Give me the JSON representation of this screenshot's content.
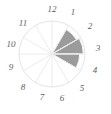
{
  "figure": {
    "type_name": "polar-sector-diagram",
    "background_color": "#ffffff",
    "frame_line_color": "#dadada"
  },
  "geometry": {
    "center_x": 52,
    "center_y": 54,
    "outer_radius": 33,
    "sector_count": 12,
    "degrees_per_sector": 30
  },
  "style": {
    "sector_fill_color": "#9b9b9b",
    "spoke_color": "#ececec",
    "circle_outline_color": "#e4e4e4",
    "label_color": "#5e5e5e",
    "label_font_size": "9px"
  },
  "labels": [
    {
      "text": "12",
      "hour": 12,
      "x": 52,
      "y": 9
    },
    {
      "text": "1",
      "hour": 1,
      "x": 73,
      "y": 12
    },
    {
      "text": "2",
      "hour": 2,
      "x": 90,
      "y": 26
    },
    {
      "text": "3",
      "hour": 3,
      "x": 98,
      "y": 48
    },
    {
      "text": "4",
      "hour": 4,
      "x": 95,
      "y": 70
    },
    {
      "text": "5",
      "hour": 5,
      "x": 82,
      "y": 88
    },
    {
      "text": "6",
      "hour": 6,
      "x": 62,
      "y": 98
    },
    {
      "text": "7",
      "hour": 7,
      "x": 42,
      "y": 97
    },
    {
      "text": "8",
      "hour": 8,
      "x": 23,
      "y": 87
    },
    {
      "text": "9",
      "hour": 9,
      "x": 11,
      "y": 67
    },
    {
      "text": "10",
      "hour": 10,
      "x": 11,
      "y": 44
    },
    {
      "text": "11",
      "hour": 11,
      "x": 23,
      "y": 23
    }
  ],
  "chart_data": {
    "type": "pie",
    "subtitle": "",
    "xlabel": "",
    "ylabel": "",
    "legend_position": "none",
    "grid": true,
    "axis_ranges": {
      "theta_deg": [
        0,
        360
      ],
      "r": [
        0,
        1
      ]
    },
    "categories": [
      "12",
      "1",
      "2",
      "3",
      "4",
      "5",
      "6",
      "7",
      "8",
      "9",
      "10",
      "11"
    ],
    "tick_labels": [
      "1",
      "2",
      "3",
      "4",
      "5",
      "6",
      "7",
      "8",
      "9",
      "10",
      "11",
      "12"
    ],
    "series": [
      {
        "name": "sector magnitude",
        "values": [
          0,
          0.86,
          0.95,
          0.84,
          0,
          0,
          0,
          0,
          0,
          0,
          0,
          0
        ]
      }
    ],
    "sectors": [
      {
        "label": "12",
        "start_hour": 12,
        "end_hour": 1,
        "start_deg": 0,
        "end_deg": 30,
        "value": 0,
        "filled": false
      },
      {
        "label": "1",
        "start_hour": 1,
        "end_hour": 2,
        "start_deg": 30,
        "end_deg": 60,
        "value": 0.86,
        "filled": true
      },
      {
        "label": "2",
        "start_hour": 2,
        "end_hour": 3,
        "start_deg": 60,
        "end_deg": 90,
        "value": 0.95,
        "filled": true
      },
      {
        "label": "3",
        "start_hour": 3,
        "end_hour": 4,
        "start_deg": 90,
        "end_deg": 120,
        "value": 0.84,
        "filled": true
      },
      {
        "label": "4",
        "start_hour": 4,
        "end_hour": 5,
        "start_deg": 120,
        "end_deg": 150,
        "value": 0,
        "filled": false
      },
      {
        "label": "5",
        "start_hour": 5,
        "end_hour": 6,
        "start_deg": 150,
        "end_deg": 180,
        "value": 0,
        "filled": false
      },
      {
        "label": "6",
        "start_hour": 6,
        "end_hour": 7,
        "start_deg": 180,
        "end_deg": 210,
        "value": 0,
        "filled": false
      },
      {
        "label": "7",
        "start_hour": 7,
        "end_hour": 8,
        "start_deg": 210,
        "end_deg": 240,
        "value": 0,
        "filled": false
      },
      {
        "label": "8",
        "start_hour": 8,
        "end_hour": 9,
        "start_deg": 240,
        "end_deg": 270,
        "value": 0,
        "filled": false
      },
      {
        "label": "9",
        "start_hour": 9,
        "end_hour": 10,
        "start_deg": 270,
        "end_deg": 300,
        "value": 0,
        "filled": false
      },
      {
        "label": "10",
        "start_hour": 10,
        "end_hour": 11,
        "start_deg": 300,
        "end_deg": 330,
        "value": 0,
        "filled": false
      },
      {
        "label": "11",
        "start_hour": 11,
        "end_hour": 12,
        "start_deg": 330,
        "end_deg": 360,
        "value": 0,
        "filled": false
      }
    ]
  }
}
